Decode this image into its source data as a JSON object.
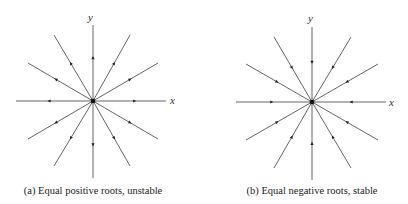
{
  "panels": [
    {
      "id": "a",
      "caption": "(a) Equal positive roots, unstable",
      "x_label": "x",
      "y_label": "y",
      "flow": "outward",
      "center": [
        93,
        101
      ],
      "ends": [
        [
          93,
          25
        ],
        [
          93,
          178
        ],
        [
          16,
          101
        ],
        [
          166,
          101
        ],
        [
          54,
          35
        ],
        [
          130,
          35
        ],
        [
          28,
          63
        ],
        [
          158,
          63
        ],
        [
          28,
          139
        ],
        [
          158,
          139
        ],
        [
          54,
          166
        ],
        [
          130,
          166
        ]
      ]
    },
    {
      "id": "b",
      "caption": "(b) Equal negative roots, stable",
      "x_label": "x",
      "y_label": "y",
      "flow": "inward",
      "center": [
        312,
        102
      ],
      "ends": [
        [
          312,
          27
        ],
        [
          312,
          180
        ],
        [
          236,
          102
        ],
        [
          386,
          102
        ],
        [
          274,
          37
        ],
        [
          351,
          37
        ],
        [
          246,
          64
        ],
        [
          378,
          64
        ],
        [
          246,
          140
        ],
        [
          378,
          140
        ],
        [
          274,
          168
        ],
        [
          351,
          168
        ]
      ]
    }
  ],
  "colors": {
    "line": "#555555",
    "node": "#111111",
    "text": "#222222"
  }
}
